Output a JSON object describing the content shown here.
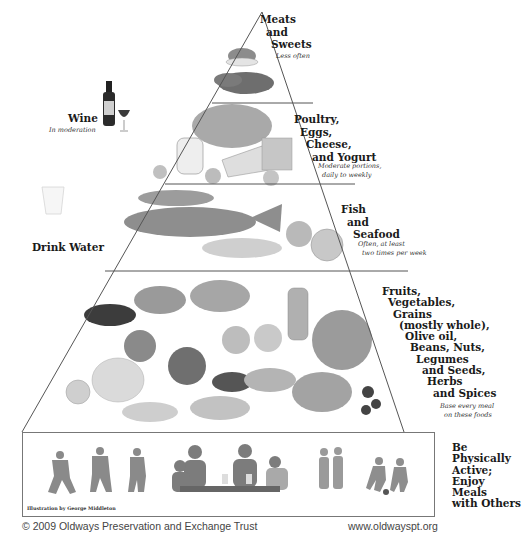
{
  "diagram": {
    "type": "food pyramid",
    "colors": {
      "line": "#555555",
      "text": "#1a1a1a",
      "note": "#333333",
      "footer": "#444444",
      "illustration": "#8a8a8a"
    }
  },
  "tiers": [
    {
      "id": "meats-sweets",
      "label_lines": [
        "Meats",
        "and",
        "Sweets"
      ],
      "note_lines": [
        "Less often"
      ],
      "illustration": "dessert bowl and meat"
    },
    {
      "id": "poultry-eggs-cheese-yogurt",
      "label_lines": [
        "Poultry,",
        "Eggs,",
        "Cheese,",
        "and Yogurt"
      ],
      "note_lines": [
        "Moderate portions,",
        "daily to weekly"
      ],
      "illustration": "roast chicken, yogurt, eggs, cheese"
    },
    {
      "id": "fish-seafood",
      "label_lines": [
        "Fish",
        "and",
        "Seafood"
      ],
      "note_lines": [
        "Often, at least",
        "two times per week"
      ],
      "illustration": "fish, shrimp, clams, scallops"
    },
    {
      "id": "plant-foods",
      "label_lines": [
        "Fruits,",
        "Vegetables,",
        "Grains",
        "(mostly whole),",
        "Olive oil,",
        "Beans, Nuts,",
        "Legumes",
        "and Seeds,",
        "Herbs",
        "and Spices"
      ],
      "note_lines": [
        "Base every meal",
        "on these foods"
      ],
      "illustration": "eggplant, grapes, garlic, tomato, bread, olive oil, beans"
    }
  ],
  "base": {
    "label_lines": [
      "Be",
      "Physically",
      "Active;",
      "Enjoy",
      "Meals",
      "with Others"
    ],
    "credit": "Illustration by George Middleton",
    "illustration": "people dancing, family eating, couple walking, kids playing soccer"
  },
  "side_items": {
    "wine": {
      "label": "Wine",
      "note": "In moderation",
      "illustration": "wine bottle and glass"
    },
    "water": {
      "label": "Drink Water",
      "illustration": "glass of water"
    }
  },
  "footer": {
    "copyright": "© 2009 Oldways Preservation and Exchange Trust",
    "url": "www.oldwayspt.org"
  }
}
